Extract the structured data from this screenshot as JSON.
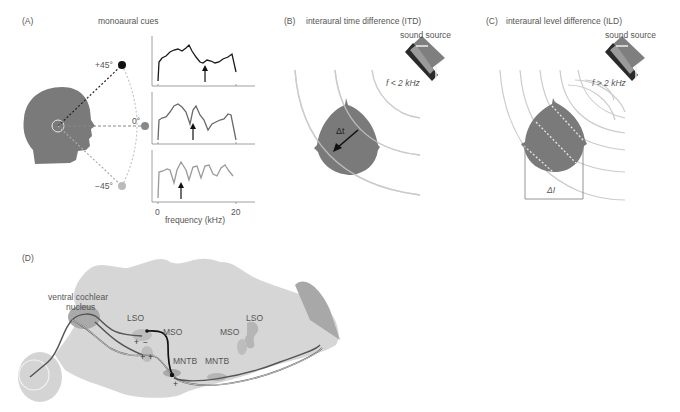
{
  "panels": {
    "A": {
      "tag": "(A)",
      "title": "monoaural cues",
      "angles": [
        "+45°",
        "0°",
        "−45°"
      ],
      "xlabel": "frequency (kHz)",
      "xticks": [
        "0",
        "20"
      ]
    },
    "B": {
      "tag": "(B)",
      "title": "interaural time difference (ITD)",
      "source_label": "sound source",
      "freq_label": "f < 2 kHz",
      "delta_label": "Δt"
    },
    "C": {
      "tag": "(C)",
      "title": "interaural level difference (ILD)",
      "source_label": "sound source",
      "freq_label": "f > 2 kHz",
      "delta_label": "ΔI"
    },
    "D": {
      "tag": "(D)",
      "nucleus_label_1": "ventral cochlear",
      "nucleus_label_2": "nucleus",
      "left": {
        "lso": "LSO",
        "mso": "MSO",
        "mntb": "MNTB"
      },
      "right": {
        "lso": "LSO",
        "mso": "MSO",
        "mntb": "MNTB"
      },
      "signs": {
        "plus": "+",
        "minus": "−"
      }
    }
  },
  "colors": {
    "head": "#7a7a7a",
    "brain": "#d6d6d6",
    "wave": "#c8c8c8",
    "trace_dark": "#1a1a1a",
    "trace_mid": "#6a6a6a",
    "trace_light": "#9a9a9a"
  }
}
